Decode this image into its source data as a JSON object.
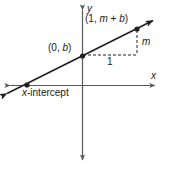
{
  "figure": {
    "background_color": "#ffffff",
    "stroke_color": "#231f20",
    "axis_color": "#58595b"
  },
  "axes": {
    "x_label": "x",
    "y_label": "y",
    "x_axis": {
      "y": 85,
      "x_start": 4,
      "x_end": 161
    },
    "y_axis": {
      "x": 82,
      "y_start": 4,
      "y_end": 166
    }
  },
  "line": {
    "label": "linear function y = mx + b",
    "start": {
      "x": 2,
      "y": 96
    },
    "end": {
      "x": 159,
      "y": 17
    },
    "slope_screen": -0.503
  },
  "points": [
    {
      "name": "y-intercept-point",
      "label": "(0, b)",
      "x": 82,
      "y": 55
    },
    {
      "name": "rise-point",
      "label": "(1, m + b)",
      "x": 137,
      "y": 28
    },
    {
      "name": "x-intercept-point",
      "label": "x-intercept",
      "x": 27,
      "y": 85
    }
  ],
  "labels": {
    "point_top": "(1, m + b)",
    "point_yintercept": "(0, b)",
    "rise": "m",
    "run": "1",
    "x_intercept": "x-intercept",
    "x_axis": "x",
    "y_axis": "y"
  },
  "slope_triangle": {
    "run_segment": {
      "x1": 82,
      "y1": 55,
      "x2": 137,
      "y2": 55
    },
    "rise_segment": {
      "x1": 137,
      "y1": 30,
      "x2": 137,
      "y2": 55
    },
    "dash_pattern": "3 2"
  },
  "chart_data": {
    "type": "line",
    "title": "",
    "xlabel": "x",
    "ylabel": "y",
    "grid": false,
    "legend": false,
    "annotations": [
      {
        "text": "(1, m + b)",
        "x": 1,
        "y": "m + b"
      },
      {
        "text": "(0, b)",
        "x": 0,
        "y": "b"
      },
      {
        "text": "x-intercept",
        "x": "-b/m",
        "y": 0
      },
      {
        "text": "m",
        "note": "rise of slope triangle"
      },
      {
        "text": "1",
        "note": "run of slope triangle"
      }
    ],
    "series": [
      {
        "name": "y = mx + b",
        "x": [
          -1.5,
          1.4
        ],
        "values": [
          "-1.5m + b",
          "1.4m + b"
        ]
      }
    ]
  }
}
